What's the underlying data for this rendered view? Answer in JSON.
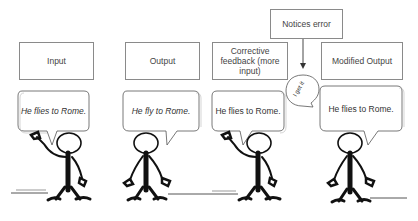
{
  "diagram": {
    "top_boxes": [
      {
        "id": "input",
        "label": "Input"
      },
      {
        "id": "output",
        "label": "Output"
      },
      {
        "id": "corrective-feedback",
        "label": "Corrective feedback (more input)"
      },
      {
        "id": "modified-output",
        "label": "Modified Output"
      }
    ],
    "notices_box": {
      "label": "Notices error"
    },
    "speech_bubbles": [
      {
        "text": "He flies to Rome.",
        "style": "italic"
      },
      {
        "text": "He fly to Rome.",
        "style": "italic"
      },
      {
        "text": "He flies to Rome.",
        "style": "normal"
      },
      {
        "text": "He flies to Rome.",
        "style": "normal"
      }
    ],
    "thought_bubble": {
      "text": "I get it"
    },
    "figures": [
      {
        "pose": "waving-right-arm"
      },
      {
        "pose": "arms-down"
      },
      {
        "pose": "waving-right-arm"
      },
      {
        "pose": "arms-down"
      }
    ],
    "colors": {
      "line": "#222222",
      "box_border": "#8a8a8a",
      "text": "#444444"
    }
  }
}
